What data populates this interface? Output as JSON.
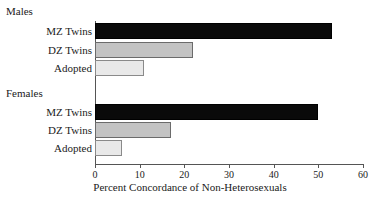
{
  "chart_data": {
    "type": "bar",
    "orientation": "horizontal",
    "title": "",
    "xlabel": "Percent Concordance of Non-Heterosexuals",
    "ylabel": "",
    "xlim": [
      0,
      60
    ],
    "xticks": [
      0,
      10,
      20,
      30,
      40,
      50,
      60
    ],
    "grid": false,
    "legend": "none",
    "groups": [
      {
        "name": "Males",
        "categories": [
          "MZ Twins",
          "DZ Twins",
          "Adopted"
        ],
        "values": [
          53,
          22,
          11
        ],
        "colors": [
          "#0a0a0a",
          "#c3c3c3",
          "#e9e9e9"
        ]
      },
      {
        "name": "Females",
        "categories": [
          "MZ Twins",
          "DZ Twins",
          "Adopted"
        ],
        "values": [
          50,
          17,
          6
        ],
        "colors": [
          "#0a0a0a",
          "#c3c3c3",
          "#e9e9e9"
        ]
      }
    ]
  },
  "labels": {
    "males_header": "Males",
    "females_header": "Females",
    "males_mz": "MZ Twins",
    "males_dz": "DZ Twins",
    "males_adopted": "Adopted",
    "females_mz": "MZ Twins",
    "females_dz": "DZ Twins",
    "females_adopted": "Adopted"
  },
  "axis": {
    "title": "Percent Concordance of Non-Heterosexuals",
    "tick_labels": [
      "0",
      "10",
      "20",
      "30",
      "40",
      "50",
      "60"
    ]
  }
}
